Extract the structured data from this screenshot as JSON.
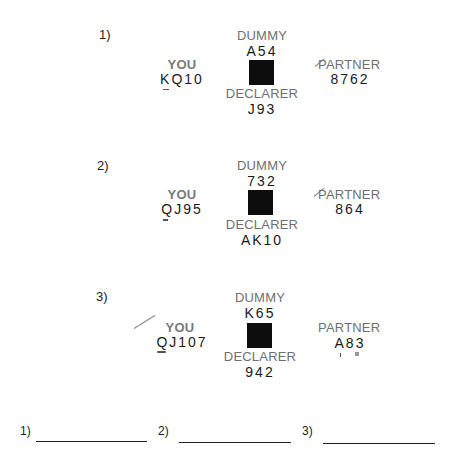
{
  "problems": [
    {
      "number": "1)",
      "dummy_label": "DUMMY",
      "dummy_cards": "A54",
      "you_label": "YOU",
      "you_cards": "KQ10",
      "partner_label": "PARTNER",
      "partner_cards": "8762",
      "declarer_label": "DECLARER",
      "declarer_cards": "J93"
    },
    {
      "number": "2)",
      "dummy_label": "DUMMY",
      "dummy_cards": "732",
      "you_label": "YOU",
      "you_cards": "QJ95",
      "partner_label": "PARTNER",
      "partner_cards": "864",
      "declarer_label": "DECLARER",
      "declarer_cards": "AK10"
    },
    {
      "number": "3)",
      "dummy_label": "DUMMY",
      "dummy_cards": "K65",
      "you_label": "YOU",
      "you_cards": "QJ107",
      "partner_label": "PARTNER",
      "partner_cards": "A83",
      "declarer_label": "DECLARER",
      "declarer_cards": "942"
    }
  ],
  "answers": [
    {
      "number": "1)",
      "value": ""
    },
    {
      "number": "2)",
      "value": ""
    },
    {
      "number": "3)",
      "value": ""
    }
  ],
  "colors": {
    "label": "#6f6f6f",
    "cards": "#1a1a1a",
    "table": "#0d0d0d"
  }
}
